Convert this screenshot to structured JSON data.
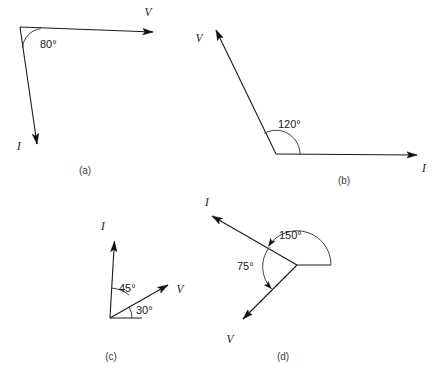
{
  "figure": {
    "background_color": "#ffffff",
    "line_color": "#1a1a1a",
    "width": 440,
    "height": 389
  },
  "panels": [
    {
      "id": "a",
      "caption": "(a)",
      "caption_x": 85,
      "caption_y": 174,
      "vertex": {
        "x": 20,
        "y": 27
      },
      "angle": {
        "text": "80°",
        "value": 80,
        "label_x": 40,
        "label_y": 48,
        "arc_radius": 21
      },
      "vectors": [
        {
          "name": "V",
          "label": "V",
          "label_x": 148,
          "label_y": 16,
          "tip_x": 162,
          "tip_y": 33,
          "angle_deg": 3
        },
        {
          "name": "I",
          "label": "I",
          "label_x": 19,
          "label_y": 150,
          "tip_x": 40,
          "tip_y": 154,
          "angle_deg": -83
        }
      ]
    },
    {
      "id": "b",
      "caption": "(b)",
      "caption_x": 344,
      "caption_y": 184,
      "vertex": {
        "x": 276,
        "y": 154
      },
      "angle": {
        "text": "120°",
        "value": 120,
        "label_x": 278,
        "label_y": 128,
        "arc_radius": 24
      },
      "vectors": [
        {
          "name": "V",
          "label": "V",
          "label_x": 199,
          "label_y": 42,
          "tip_x": 212,
          "tip_y": 23,
          "angle_deg": 120
        },
        {
          "name": "I",
          "label": "I",
          "label_x": 424,
          "label_y": 172,
          "tip_x": 426,
          "tip_y": 155,
          "angle_deg": 0
        }
      ]
    },
    {
      "id": "c",
      "caption": "(c)",
      "caption_x": 111,
      "caption_y": 360,
      "vertex": {
        "x": 110,
        "y": 318
      },
      "angles": [
        {
          "text": "45°",
          "value": 45,
          "label_x": 119,
          "label_y": 292,
          "arc_radius": 30
        },
        {
          "text": "30°",
          "value": 30,
          "label_x": 136,
          "label_y": 314,
          "arc_radius": 22
        }
      ],
      "reference_line": {
        "x1": 110,
        "y1": 318,
        "x2": 142,
        "y2": 318
      },
      "vectors": [
        {
          "name": "I",
          "label": "I",
          "label_x": 103,
          "label_y": 230,
          "tip_x": 117,
          "tip_y": 233,
          "angle_deg": 75
        },
        {
          "name": "V",
          "label": "V",
          "label_x": 180,
          "label_y": 293,
          "tip_x": 176,
          "tip_y": 279,
          "angle_deg": 30
        }
      ]
    },
    {
      "id": "d",
      "caption": "(d)",
      "caption_x": 283,
      "caption_y": 360,
      "vertex": {
        "x": 297,
        "y": 265
      },
      "angles": [
        {
          "text": "150°",
          "value": 150,
          "label_x": 279,
          "label_y": 239,
          "arc_radius": 34
        },
        {
          "text": "75°",
          "value": 75,
          "label_x": 237,
          "label_y": 270,
          "arc_radius": 32
        }
      ],
      "reference_line": {
        "x1": 297,
        "y1": 265,
        "x2": 331,
        "y2": 265
      },
      "vectors": [
        {
          "name": "I",
          "label": "I",
          "label_x": 207,
          "label_y": 206,
          "tip_x": 204,
          "tip_y": 212,
          "angle_deg": 150
        },
        {
          "name": "V",
          "label": "V",
          "label_x": 230,
          "label_y": 343,
          "tip_x": 236,
          "tip_y": 326,
          "angle_deg": 225
        }
      ]
    }
  ]
}
